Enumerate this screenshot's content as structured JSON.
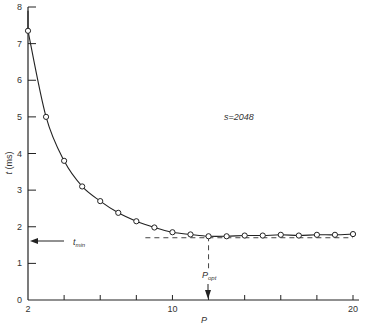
{
  "chart_data": {
    "type": "line",
    "title": "",
    "xlabel": "P",
    "ylabel": "t (ms)",
    "xlim": [
      2,
      20
    ],
    "ylim": [
      0,
      8
    ],
    "x_ticks": [
      2,
      4,
      6,
      8,
      10,
      12,
      14,
      16,
      18,
      20
    ],
    "x_tick_labels": [
      "2",
      "",
      "",
      "",
      "10",
      "",
      "",
      "",
      "",
      "20"
    ],
    "y_ticks": [
      0,
      1,
      2,
      3,
      4,
      5,
      6,
      7,
      8
    ],
    "y_tick_labels": [
      "0",
      "1",
      "2",
      "3",
      "4",
      "5",
      "6",
      "7",
      "8"
    ],
    "grid": false,
    "legend": null,
    "series": [
      {
        "name": "s=2048",
        "marker": "open-circle",
        "x": [
          2,
          3,
          4,
          5,
          6,
          7,
          8,
          9,
          10,
          11,
          12,
          13,
          14,
          15,
          16,
          17,
          18,
          19,
          20
        ],
        "values": [
          7.35,
          5.0,
          3.8,
          3.1,
          2.7,
          2.38,
          2.15,
          1.98,
          1.85,
          1.79,
          1.74,
          1.74,
          1.76,
          1.76,
          1.78,
          1.76,
          1.78,
          1.78,
          1.8
        ]
      }
    ],
    "annotations": [
      {
        "text": "s=2048",
        "x": 15,
        "y": 5.0
      },
      {
        "text": "t_min",
        "type": "arrow-to-y-axis",
        "y": 1.7
      },
      {
        "text": "P_opt",
        "type": "arrow-to-x-axis",
        "x": 12
      }
    ],
    "reference_lines": [
      {
        "orientation": "horizontal",
        "y": 1.7,
        "style": "dashed",
        "x_from": 8.5,
        "x_to": 20
      },
      {
        "orientation": "vertical",
        "x": 12,
        "style": "dashed",
        "y_from": 0.3,
        "y_to": 1.74
      }
    ]
  },
  "labels": {
    "ylabel_main": "t",
    "ylabel_unit": "(ms)",
    "xlabel": "P",
    "series_note": "s=2048",
    "tmin_main": "t",
    "tmin_sub": "min",
    "popt_main": "P",
    "popt_sub": "opt"
  }
}
